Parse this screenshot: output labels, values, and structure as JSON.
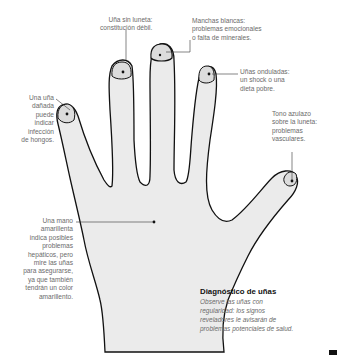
{
  "annotations": {
    "weak_nail": [
      "Uña sin luneta:",
      "constitución débil."
    ],
    "white_spots": [
      "Manchas blancas:",
      "problemas emocionales",
      "o falta de minerales."
    ],
    "wavy_nails": [
      "Uñas onduladas:",
      "un shock o una",
      "dieta pobre."
    ],
    "damaged_nail": [
      "Una uña",
      "dañada",
      "puede",
      "indicar",
      "infección",
      "de hongos."
    ],
    "bluish_tone": [
      "Tono azulazo",
      "sobre la luneta:",
      "problemas",
      "vasculares."
    ],
    "yellow_hand": [
      "Una mano",
      "amarillenta",
      "indica posibles",
      "problemas",
      "hepáticos, pero",
      "mire las uñas",
      "para asegurarse,",
      "ya que también",
      "tendrán un color",
      "amarillento."
    ]
  },
  "info_box": {
    "title": "Diagnóstico de uñas",
    "lines": [
      "Observe las uñas con",
      "regularidad: los signos",
      "reveladores le avisarán de",
      "problemas potenciales de salud."
    ]
  },
  "colors": {
    "hand_fill": "#ebebeb",
    "outline": "#111111",
    "text": "#6b6b6b"
  }
}
